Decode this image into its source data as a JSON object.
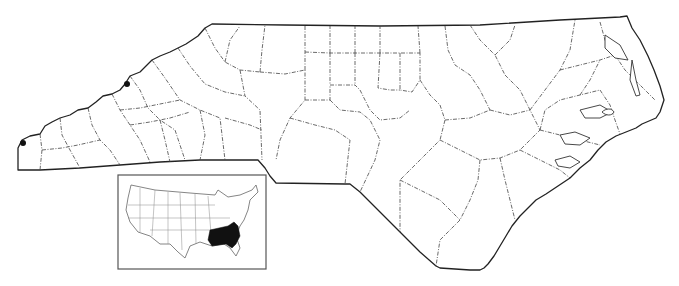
{
  "map": {
    "title": "North Carolina county map",
    "background": "#ffffff",
    "ink_color": "#222222",
    "region": "North Carolina",
    "records": [
      {
        "label": "record-1",
        "x": 127,
        "y": 84
      },
      {
        "label": "record-2",
        "x": 23,
        "y": 143
      }
    ],
    "inset": {
      "title": "United States inset",
      "frame": {
        "x": 118,
        "y": 175,
        "width": 148,
        "height": 94
      },
      "highlighted_range": "Southeastern United States (filled black)",
      "range_color": "#111111"
    }
  }
}
